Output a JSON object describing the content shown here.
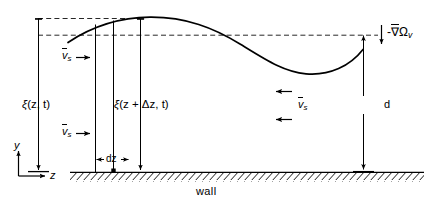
{
  "figure": {
    "type": "schematic-diagram",
    "line_color": "#000000",
    "background_color": "#ffffff",
    "width": 424,
    "height": 206
  },
  "labels": {
    "xi_z_t": {
      "text": "ξ(z, t)",
      "symbol": "ξ",
      "args": "(z, t)",
      "x": 22,
      "y": 99
    },
    "xi_z_dz_t": {
      "text": "ξ(z + Δz, t)",
      "symbol": "ξ",
      "args": "(z + Δz, t)",
      "x": 114,
      "y": 99
    },
    "v_s_upper_left": {
      "symbol": "v",
      "subscript": "s",
      "overbar": true,
      "x": 62,
      "y": 56,
      "arrow_direction": "right"
    },
    "v_s_lower_left": {
      "symbol": "v",
      "subscript": "s",
      "overbar": true,
      "x": 62,
      "y": 132,
      "arrow_direction": "right"
    },
    "v_s_right": {
      "symbol": "v",
      "subscript": "s",
      "overbar": true,
      "x": 303,
      "y": 101,
      "arrow_direction": "left"
    },
    "dz": {
      "text": "dz",
      "x": 111,
      "y": 159
    },
    "d": {
      "text": "d",
      "x": 386,
      "y": 104
    },
    "wall": {
      "text": "wall",
      "x": 196,
      "y": 192
    },
    "grad_omega": {
      "text": "-∇Ω",
      "minus": "-",
      "nabla": "∇",
      "omega": "Ω",
      "subscript": "v",
      "overbar": true,
      "x": 392,
      "y": 33,
      "arrow_direction": "down"
    },
    "axis_y": {
      "text": "y",
      "x": 14,
      "y": 146
    },
    "axis_z": {
      "text": "z",
      "x": 52,
      "y": 184
    }
  },
  "geometry": {
    "wall_line_y": 172,
    "wall_x_start": 70,
    "wall_x_end": 424,
    "mean_level_y": 35,
    "crest_dashed_y": 18,
    "curve_description": "one full sinusoidal period, crest near x=150, trough near x=300",
    "vertical_lines_x": [
      38,
      95,
      113,
      140,
      363
    ],
    "axis_origin": {
      "x": 18,
      "y": 176
    }
  }
}
